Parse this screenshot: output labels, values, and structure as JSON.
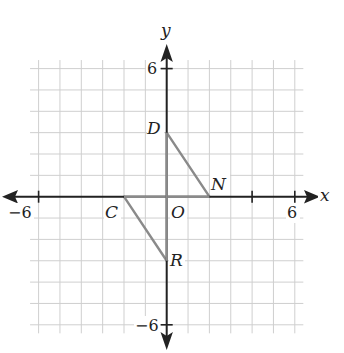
{
  "chart_data": {
    "type": "scatter",
    "title": "",
    "xlabel": "x",
    "ylabel": "y",
    "xlim": [
      -6,
      6
    ],
    "ylim": [
      -6,
      6
    ],
    "grid": true,
    "grid_step": 1,
    "x_tick_labels": [
      "-6",
      "6"
    ],
    "y_tick_labels": [
      "6",
      "-6"
    ],
    "origin_label": "O",
    "points": [
      {
        "name": "D",
        "x": 0,
        "y": 3
      },
      {
        "name": "N",
        "x": 2,
        "y": 0
      },
      {
        "name": "C",
        "x": -2,
        "y": 0
      },
      {
        "name": "R",
        "x": 0,
        "y": -3
      }
    ],
    "segments": [
      {
        "from": "D",
        "to": "N"
      },
      {
        "from": "C",
        "to": "R"
      },
      {
        "from": "C",
        "to": "N"
      },
      {
        "from": "D",
        "to": "R"
      }
    ],
    "colors": {
      "axis": "#222222",
      "grid": "#c8c8c8",
      "shape": "#8a8a8a"
    }
  },
  "labels": {
    "x_axis": "x",
    "y_axis": "y",
    "origin": "O",
    "x_min": "−6",
    "x_max": "6",
    "y_max": "6",
    "y_min": "−6",
    "D": "D",
    "N": "N",
    "C": "C",
    "R": "R"
  }
}
